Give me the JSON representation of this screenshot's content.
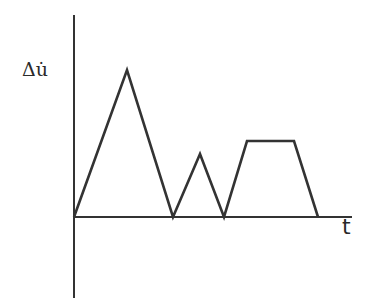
{
  "chart_data": {
    "type": "line",
    "title": "",
    "xlabel": "t",
    "ylabel": "Δu̇",
    "grid": false,
    "legend": null,
    "axes": {
      "origin_px": [
        74,
        217
      ],
      "y_axis_px": {
        "x": 74,
        "top": 15,
        "bottom": 298
      },
      "x_axis_px": {
        "y": 217,
        "left": 74,
        "right": 352
      }
    },
    "series": [
      {
        "name": "Δu̇(t)",
        "color": "#333333",
        "points_px": [
          [
            74,
            217
          ],
          [
            127,
            70
          ],
          [
            173,
            217
          ],
          [
            200,
            154
          ],
          [
            224,
            217
          ],
          [
            247,
            141
          ],
          [
            294,
            141
          ],
          [
            318,
            217
          ]
        ],
        "relative_values": {
          "x": [
            0,
            53,
            99,
            126,
            150,
            173,
            220,
            244
          ],
          "y": [
            0,
            147,
            0,
            63,
            0,
            76,
            76,
            0
          ]
        }
      }
    ]
  },
  "labels": {
    "y_axis": "Δu̇",
    "x_axis": "t"
  },
  "colors": {
    "line": "#333333",
    "background": "#ffffff"
  }
}
